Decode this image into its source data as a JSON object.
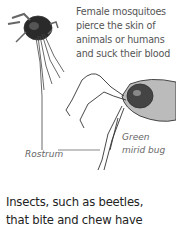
{
  "mosquito": {
    "caption_lines": [
      "Female mosquitoes",
      "pierce the skin of",
      "animals or humans",
      "and suck their blood"
    ]
  },
  "mirid_bug": {
    "label_lines": [
      "Green",
      "mirid bug"
    ]
  },
  "rostrum": {
    "label": "Rostrum"
  },
  "body_text": {
    "lines": [
      "Insects, such as beetles,",
      "that bite and chew have"
    ]
  }
}
